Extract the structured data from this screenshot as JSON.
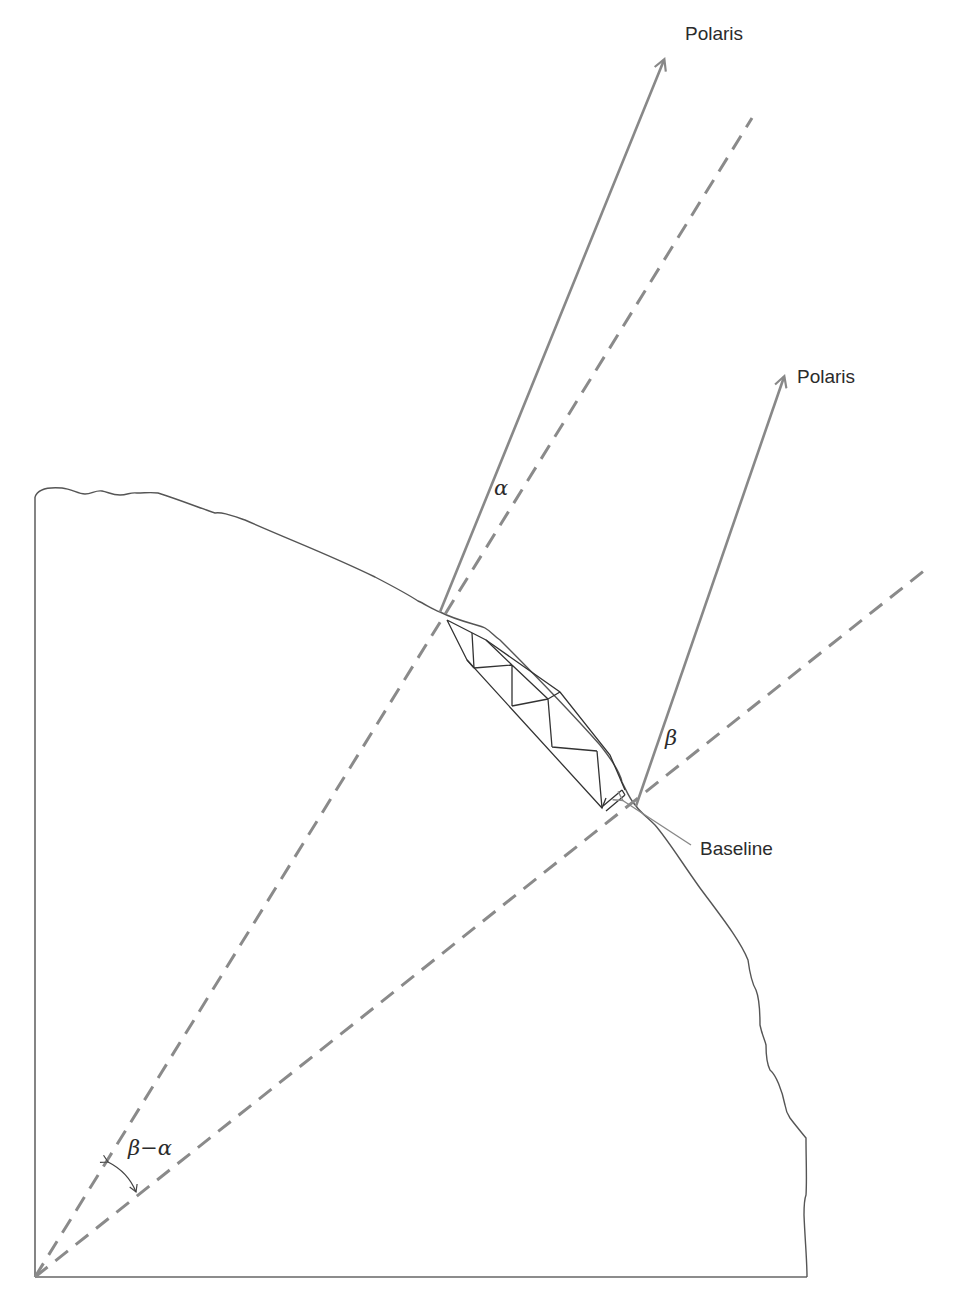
{
  "figure": {
    "labels": {
      "polaris_1": "Polaris",
      "polaris_2": "Polaris",
      "alpha": "α",
      "beta": "β",
      "beta_minus_alpha": "β−α",
      "baseline": "Baseline"
    },
    "colors": {
      "ray": "#888888",
      "radius_dashed": "#8a8a8a",
      "earth_outline": "#555555",
      "truss": "#333333",
      "text": "#2b2b2b",
      "background": "#ffffff"
    },
    "elements": [
      {
        "name": "earth-center",
        "type": "point"
      },
      {
        "name": "earth-surface-arc",
        "type": "outline"
      },
      {
        "name": "radius-line-1",
        "type": "dashed line",
        "to": "observation point 1"
      },
      {
        "name": "radius-line-2",
        "type": "dashed line",
        "to": "observation point 2"
      },
      {
        "name": "polaris-ray-1",
        "type": "arrow",
        "label": "Polaris"
      },
      {
        "name": "polaris-ray-2",
        "type": "arrow",
        "label": "Polaris"
      },
      {
        "name": "triangulation-chain",
        "type": "truss diagram"
      },
      {
        "name": "baseline-pointer",
        "type": "leader line",
        "label": "Baseline"
      },
      {
        "name": "central-angle-arc",
        "type": "double arrow arc",
        "label": "β−α"
      }
    ]
  }
}
